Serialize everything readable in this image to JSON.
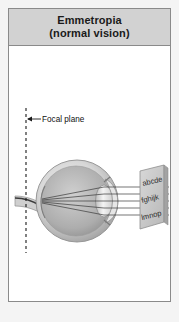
{
  "figure": {
    "title": {
      "line1": "Emmetropia",
      "line2": "(normal vision)"
    },
    "annotations": {
      "focal_plane_label": "Focal plane"
    },
    "eye_chart": {
      "rows": [
        "abcde",
        "fghijk",
        "lmnop"
      ]
    },
    "colors": {
      "title_background": "#d2d2d2",
      "border": "#8a8a8a",
      "canvas_background": "#ffffff",
      "page_background": "#f4f4f4",
      "ray_color": "#3a3a3a",
      "focal_line_color": "#1a1a1a",
      "sclera": "#d9d9d9",
      "vitreous": "#b4b4b4",
      "lens": "#ececec",
      "chart_card": "#c9c9c9"
    },
    "light_rays": {
      "count": 5,
      "direction": "right-to-left",
      "converge_at": "retina"
    }
  }
}
